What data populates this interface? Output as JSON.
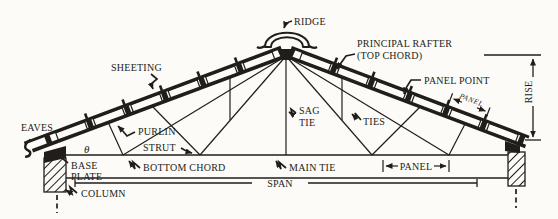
{
  "figure": {
    "type": "technical-line-drawing",
    "paper_color": "#fcfbf8",
    "ink_color": "#211e1a"
  },
  "labels": {
    "ridge": "RIDGE",
    "principal_rafter": [
      "PRINCIPAL RAFTER",
      "(TOP CHORD)"
    ],
    "sheeting": "SHEETING",
    "panel_point": "PANEL POINT",
    "panel_upper_dim": "PANEL",
    "rise": "RISE",
    "eaves": "EAVES",
    "purlin": "PURLIN",
    "sag_tie": [
      "SAG",
      "TIE"
    ],
    "ties": "TIES",
    "theta": "θ",
    "strut": "STRUT",
    "base_plate": [
      "BASE",
      "PLATE"
    ],
    "bottom_chord": "BOTTOM CHORD",
    "main_tie": "MAIN TIE",
    "panel_lower_dim": "PANEL",
    "span": "SPAN",
    "column": "COLUMN"
  }
}
